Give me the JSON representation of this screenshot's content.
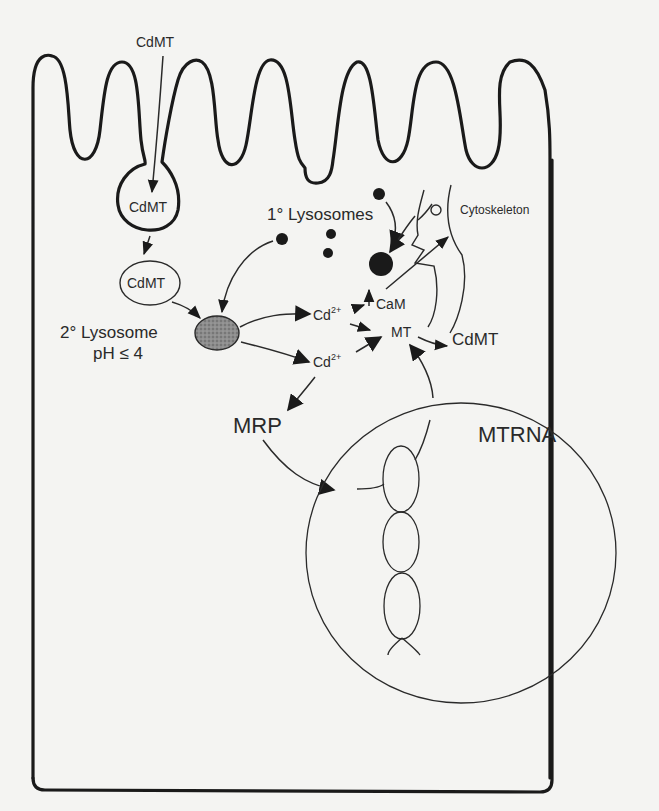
{
  "diagram": {
    "type": "cell-pathway",
    "labels": {
      "cdmt_extracellular": "CdMT",
      "cdmt_endosome": "CdMT",
      "cdmt_vesicle": "CdMT",
      "secondary_lysosome": "2° Lysosome",
      "secondary_lysosome_ph": "pH ≤ 4",
      "primary_lysosomes": "1° Lysosomes",
      "cytoskeleton": "Cytoskeleton",
      "cd2_upper": "Cd",
      "cd2_upper_charge": "2+",
      "cd2_lower": "Cd",
      "cd2_lower_charge": "2+",
      "cam": "CaM",
      "mt": "MT",
      "cdmt_cytosol": "CdMT",
      "mrp": "MRP",
      "nucleus": "MTRNA"
    },
    "nodes": [
      "CdMT (extracellular)",
      "CdMT endocytic vesicle",
      "CdMT vesicle",
      "2° Lysosome (pH ≤ 4)",
      "1° Lysosomes",
      "Cd2+",
      "CaM",
      "MT",
      "CdMT (cytosol)",
      "MRP",
      "Nucleus / MTRNA",
      "Cytoskeleton"
    ],
    "edges": [
      [
        "CdMT (extracellular)",
        "CdMT endocytic vesicle"
      ],
      [
        "CdMT endocytic vesicle",
        "CdMT vesicle"
      ],
      [
        "CdMT vesicle",
        "2° Lysosome"
      ],
      [
        "1° Lysosomes",
        "2° Lysosome"
      ],
      [
        "2° Lysosome",
        "Cd2+ (upper)"
      ],
      [
        "2° Lysosome",
        "Cd2+ (lower)"
      ],
      [
        "Cd2+ (upper)",
        "CaM"
      ],
      [
        "Cd2+ (upper)",
        "MT"
      ],
      [
        "Cd2+ (lower)",
        "MT"
      ],
      [
        "Cd2+ (lower)",
        "MRP"
      ],
      [
        "MRP",
        "Nucleus"
      ],
      [
        "Nucleus",
        "MT"
      ],
      [
        "MT",
        "CdMT (cytosol)"
      ],
      [
        "CaM",
        "Cytoskeleton"
      ],
      [
        "1° Lysosome",
        "Large lysosome"
      ],
      [
        "Cytoskeleton",
        "Large lysosome"
      ]
    ],
    "colors": {
      "ink": "#1a1a1a",
      "paper": "#f4f4f2",
      "lysosome_fill": "#8a8a8a"
    }
  }
}
